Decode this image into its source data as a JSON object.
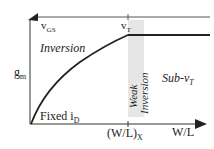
{
  "diagram": {
    "y_axis_label": "g",
    "y_axis_label_sub": "m",
    "x_axis_label": "W/L",
    "x_marker_label": "(W/L)",
    "x_marker_label_sub": "X",
    "top_line_label": "v",
    "top_line_label_sub": "GS",
    "vt_label": "v",
    "vt_label_sub": "T",
    "region_inversion": "Inversion",
    "region_weak_line1": "Weak",
    "region_weak_line2": "Inversion",
    "region_sub_vt": "Sub-v",
    "region_sub_vt_sub": "T",
    "curve_label": "Fixed i",
    "curve_label_sub": "D",
    "colors": {
      "line": "#222222",
      "band": "#e6e6e6",
      "axis": "#333333"
    }
  }
}
